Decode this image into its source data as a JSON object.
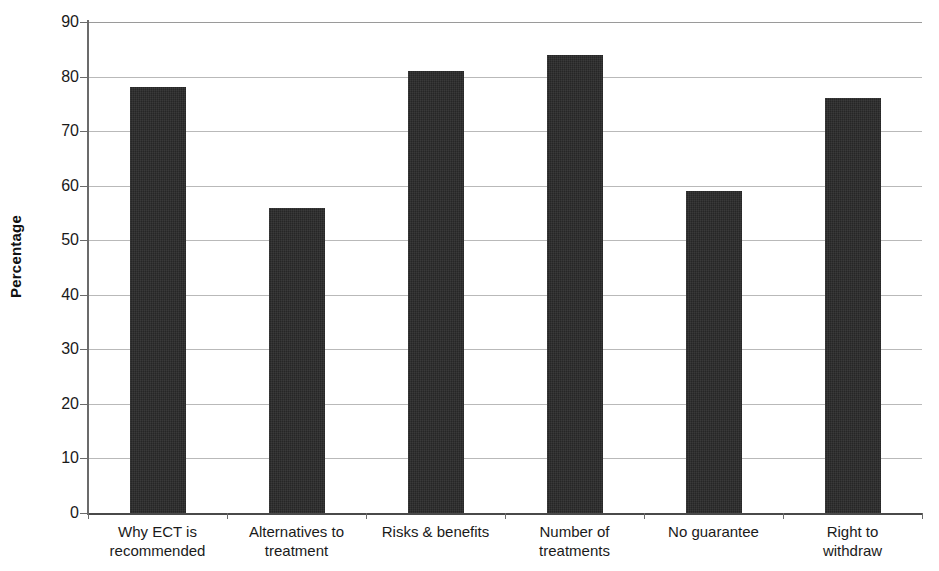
{
  "chart_data": {
    "type": "bar",
    "title": "",
    "xlabel": "",
    "ylabel": "Percentage",
    "ylim": [
      0,
      90
    ],
    "ytick_step": 10,
    "yticks": [
      90,
      80,
      70,
      60,
      50,
      40,
      30,
      20,
      10,
      0
    ],
    "ytick_labels": [
      "90",
      "80",
      "70",
      "60",
      "50",
      "40",
      "30",
      "20",
      "10",
      "0"
    ],
    "categories": [
      "Why ECT is recommended",
      "Alternatives to treatment",
      "Risks & benefits",
      "Number of treatments",
      "No guarantee",
      "Right to withdraw"
    ],
    "category_lines": [
      [
        "Why ECT is",
        "recommended"
      ],
      [
        "Alternatives to",
        "treatment"
      ],
      [
        "Risks & benefits",
        ""
      ],
      [
        "Number of",
        "treatments"
      ],
      [
        "No guarantee",
        ""
      ],
      [
        "Right to",
        "withdraw"
      ]
    ],
    "values": [
      78,
      56,
      81,
      84,
      59,
      76
    ],
    "grid": true,
    "legend": false,
    "bar_color": "#262626",
    "gridline_color": "#b9b9b9",
    "axis_color": "#6b6b6b"
  }
}
